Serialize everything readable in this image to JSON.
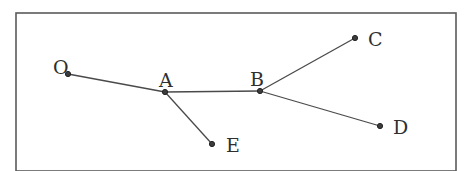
{
  "diagram": {
    "type": "tree",
    "colors": {
      "line": "#4a4a4a",
      "node": "#3c3c3c",
      "frame": "#5a5a5a",
      "text": "#2f2f2f",
      "background": "#ffffff"
    },
    "frame": {
      "x": 16,
      "y": 13,
      "width": 440,
      "height": 158
    },
    "nodes": [
      {
        "id": "O",
        "label": "O",
        "x": 68,
        "y": 74,
        "lx": 53,
        "ly": 74
      },
      {
        "id": "A",
        "label": "A",
        "x": 165,
        "y": 92,
        "lx": 159,
        "ly": 87
      },
      {
        "id": "B",
        "label": "B",
        "x": 260,
        "y": 91,
        "lx": 250,
        "ly": 86
      },
      {
        "id": "C",
        "label": "C",
        "x": 355,
        "y": 38,
        "lx": 368,
        "ly": 46
      },
      {
        "id": "D",
        "label": "D",
        "x": 380,
        "y": 126,
        "lx": 393,
        "ly": 134
      },
      {
        "id": "E",
        "label": "E",
        "x": 212,
        "y": 144,
        "lx": 226,
        "ly": 152
      }
    ],
    "edges": [
      {
        "from": "O",
        "to": "A"
      },
      {
        "from": "A",
        "to": "B"
      },
      {
        "from": "A",
        "to": "E"
      },
      {
        "from": "B",
        "to": "C"
      },
      {
        "from": "B",
        "to": "D"
      }
    ]
  }
}
